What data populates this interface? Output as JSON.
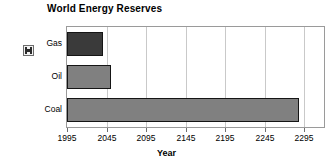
{
  "chart_data": {
    "type": "bar",
    "orientation": "horizontal",
    "title": "World Energy Reserves",
    "xlabel": "Year",
    "ylabel": "",
    "categories": [
      "Gas",
      "Oil",
      "Coal"
    ],
    "values": [
      2040,
      2051,
      2288
    ],
    "series": [
      {
        "name": "Reserves depletion year",
        "values": [
          2040,
          2051,
          2288
        ]
      }
    ],
    "xlim": [
      1995,
      2320
    ],
    "xticks": [
      1995,
      2045,
      2095,
      2145,
      2195,
      2245,
      2295
    ],
    "xtick_labels": [
      "1995",
      "2045",
      "2095",
      "2145",
      "2195",
      "2245",
      "2295"
    ],
    "xtick_interval": 50,
    "grid": true,
    "grid_axis": "x",
    "legend": false,
    "bar_colors": [
      "#3a3a3a",
      "#808080",
      "#808080"
    ],
    "bar_edge_color": "#151515",
    "grid_color": "#c9c9c9",
    "plot_border_color": "#9a9a9a",
    "background_color": "#ffffff"
  },
  "icons": {
    "series_handle": "resize-handle-icon"
  }
}
